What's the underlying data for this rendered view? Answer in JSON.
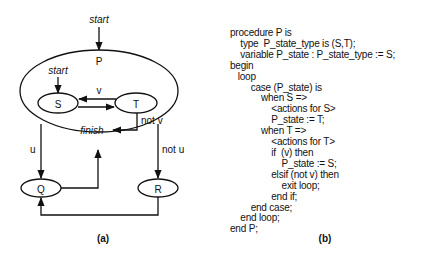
{
  "diagram_a": {
    "caption": "(a)",
    "outer_state": {
      "name": "P",
      "entry_label": "start"
    },
    "inner_states": [
      {
        "name": "S",
        "entry_label": "start"
      },
      {
        "name": "T"
      }
    ],
    "inner_transitions": [
      {
        "from": "T",
        "to": "S",
        "label": "v"
      },
      {
        "from": "S",
        "to": "T",
        "label": ""
      },
      {
        "from": "T",
        "to": "finish",
        "label": "not v",
        "target_label": "finish"
      }
    ],
    "outer_states": [
      {
        "name": "Q"
      },
      {
        "name": "R"
      }
    ],
    "outer_transitions": [
      {
        "from": "P",
        "to": "Q",
        "label": "u"
      },
      {
        "from": "P",
        "to": "R",
        "label": "not u"
      },
      {
        "from": "Q",
        "to": "P",
        "label": ""
      },
      {
        "from": "R",
        "to": "Q",
        "label": ""
      }
    ]
  },
  "diagram_b": {
    "caption": "(b)",
    "code_lines": [
      "procedure P is",
      "    type  P_state_type is (S,T);",
      "    variable P_state : P_state_type := S;",
      "begin",
      "   loop",
      "        case (P_state) is",
      "            when S =>",
      "                <actions for S>",
      "                P_state := T;",
      "            when T =>",
      "                <actions for T>",
      "                if  (v) then",
      "                    P_state := S;",
      "                elsif (not v) then",
      "                    exit loop;",
      "                end if;",
      "        end case;",
      "    end loop;",
      "end P;"
    ]
  }
}
